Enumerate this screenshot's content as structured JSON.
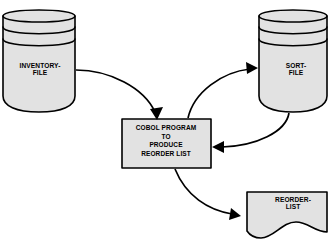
{
  "diagram": {
    "style": {
      "shape_fill": "#e2e2e2",
      "stroke": "#000000",
      "background": "#ffffff"
    },
    "nodes": [
      {
        "id": "inventory-file",
        "type": "magnetic-disk",
        "label": "INVENTORY-\nFILE"
      },
      {
        "id": "sort-file",
        "type": "magnetic-disk",
        "label": "SORT-\nFILE"
      },
      {
        "id": "cobol-program",
        "type": "process",
        "label": "COBOL PROGRAM\nTO\nPRODUCE\nREORDER LIST"
      },
      {
        "id": "reorder-list",
        "type": "document",
        "label": "REORDER-\nLIST"
      }
    ],
    "connectors": [
      {
        "id": "inventory-to-program",
        "from": "inventory-file",
        "to": "cobol-program"
      },
      {
        "id": "program-to-sort",
        "from": "cobol-program",
        "to": "sort-file"
      },
      {
        "id": "sort-to-program",
        "from": "sort-file",
        "to": "cobol-program"
      },
      {
        "id": "program-to-reorder",
        "from": "cobol-program",
        "to": "reorder-list"
      }
    ]
  }
}
